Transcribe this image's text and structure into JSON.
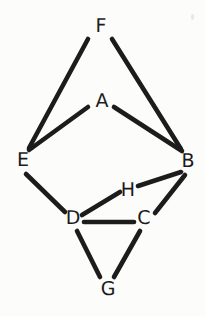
{
  "figure": {
    "kind": "undirected-graph-diagram",
    "background_color": "#fcfcfb",
    "ink_color": "#1c1c1c",
    "width": 205,
    "height": 316
  },
  "nodes": [
    {
      "id": "F",
      "label": "F",
      "x": 101,
      "y": 26
    },
    {
      "id": "A",
      "label": "A",
      "x": 102,
      "y": 101
    },
    {
      "id": "E",
      "label": "E",
      "x": 23,
      "y": 160
    },
    {
      "id": "B",
      "label": "B",
      "x": 188,
      "y": 161
    },
    {
      "id": "H",
      "label": "H",
      "x": 128,
      "y": 190
    },
    {
      "id": "D",
      "label": "D",
      "x": 73,
      "y": 218
    },
    {
      "id": "C",
      "label": "C",
      "x": 144,
      "y": 218
    },
    {
      "id": "G",
      "label": "G",
      "x": 108,
      "y": 289
    }
  ],
  "edges": [
    {
      "from": "F",
      "to": "E",
      "x1": 88,
      "y1": 39,
      "x2": 29,
      "y2": 148
    },
    {
      "from": "F",
      "to": "B",
      "x1": 112,
      "y1": 39,
      "x2": 181,
      "y2": 149
    },
    {
      "from": "A",
      "to": "E",
      "x1": 88,
      "y1": 107,
      "x2": 29,
      "y2": 150
    },
    {
      "from": "A",
      "to": "B",
      "x1": 114,
      "y1": 107,
      "x2": 182,
      "y2": 151
    },
    {
      "from": "E",
      "to": "D",
      "x1": 26,
      "y1": 174,
      "x2": 65,
      "y2": 212
    },
    {
      "from": "B",
      "to": "H",
      "x1": 181,
      "y1": 172,
      "x2": 138,
      "y2": 186
    },
    {
      "from": "B",
      "to": "C",
      "x1": 185,
      "y1": 175,
      "x2": 155,
      "y2": 213
    },
    {
      "from": "D",
      "to": "H",
      "x1": 82,
      "y1": 215,
      "x2": 120,
      "y2": 192
    },
    {
      "from": "D",
      "to": "C",
      "x1": 84,
      "y1": 222,
      "x2": 134,
      "y2": 222
    },
    {
      "from": "D",
      "to": "G",
      "x1": 77,
      "y1": 231,
      "x2": 100,
      "y2": 277
    },
    {
      "from": "C",
      "to": "G",
      "x1": 140,
      "y1": 231,
      "x2": 114,
      "y2": 277
    }
  ],
  "edge_list_text": "F-E, F-B, A-E, A-B, E-D, B-H, B-C, D-H, D-C, D-G, C-G",
  "node_count": 8,
  "edge_count": 11,
  "artifacts": [
    {
      "name": "top-right-speck",
      "x": 191,
      "y": 14,
      "w": 3,
      "h": 6
    }
  ]
}
